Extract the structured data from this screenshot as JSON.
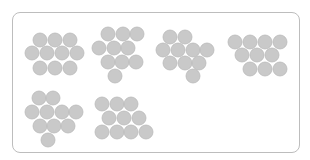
{
  "figure": {
    "dot_color": "#c9c9c9",
    "dot_edge_color": "#bababa",
    "frame_color": "#bdbdbd",
    "groups": [
      {
        "id": "group-1",
        "count": 11,
        "rows": [
          3,
          4,
          3
        ]
      },
      {
        "id": "group-2",
        "count": 10,
        "rows": [
          3,
          3,
          3,
          1
        ]
      },
      {
        "id": "group-3",
        "count": 10,
        "rows": [
          2,
          4,
          3,
          1
        ]
      },
      {
        "id": "group-4",
        "count": 10,
        "rows": [
          4,
          3,
          3
        ]
      },
      {
        "id": "group-5",
        "count": 10,
        "rows": [
          2,
          4,
          3,
          1
        ]
      },
      {
        "id": "group-6",
        "count": 10,
        "rows": [
          3,
          3,
          4
        ]
      }
    ]
  }
}
